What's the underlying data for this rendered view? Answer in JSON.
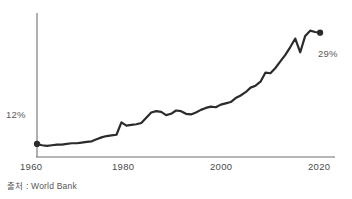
{
  "chart_data": {
    "type": "line",
    "title": "",
    "subtitle": "",
    "xlabel": "",
    "ylabel": "",
    "grid": false,
    "legend": "none",
    "xlim": [
      1960,
      2020
    ],
    "ylim": [
      10,
      32
    ],
    "xticks": [
      1960,
      1980,
      2000,
      2020
    ],
    "xtick_labels": [
      "1960",
      "1980",
      "2000",
      "2020"
    ],
    "annotations": [
      {
        "name": "start-value",
        "text": "12%",
        "x": 1960,
        "y": 12
      },
      {
        "name": "end-value",
        "text": "29%",
        "x": 2017,
        "y": 29
      }
    ],
    "markers": [
      {
        "name": "start-point",
        "x": 1960,
        "y": 12
      },
      {
        "name": "end-point",
        "x": 2017,
        "y": 29
      }
    ],
    "series": [
      {
        "name": "share",
        "color": "#2b2b2b",
        "x": [
          1960,
          1961,
          1962,
          1963,
          1964,
          1965,
          1966,
          1967,
          1968,
          1969,
          1970,
          1971,
          1972,
          1973,
          1974,
          1975,
          1976,
          1977,
          1978,
          1979,
          1980,
          1981,
          1982,
          1983,
          1984,
          1985,
          1986,
          1987,
          1988,
          1989,
          1990,
          1991,
          1992,
          1993,
          1994,
          1995,
          1996,
          1997,
          1998,
          1999,
          2000,
          2001,
          2002,
          2003,
          2004,
          2005,
          2006,
          2007,
          2008,
          2009,
          2010,
          2011,
          2012,
          2013,
          2014,
          2015,
          2016,
          2017
        ],
        "y": [
          12.0,
          11.8,
          11.7,
          11.8,
          11.9,
          11.9,
          12.0,
          12.1,
          12.1,
          12.2,
          12.3,
          12.4,
          12.7,
          13.0,
          13.2,
          13.3,
          13.4,
          15.3,
          14.8,
          14.9,
          15.0,
          15.2,
          16.0,
          16.8,
          17.0,
          16.9,
          16.4,
          16.6,
          17.1,
          17.0,
          16.6,
          16.5,
          16.8,
          17.2,
          17.5,
          17.7,
          17.6,
          18.0,
          18.2,
          18.4,
          19.0,
          19.4,
          19.9,
          20.6,
          20.9,
          21.5,
          22.9,
          22.8,
          23.6,
          24.6,
          25.6,
          26.8,
          28.1,
          26.0,
          28.5,
          29.3,
          29.1,
          29.0
        ]
      }
    ]
  },
  "labels": {
    "start_value": "12%",
    "end_value": "29%",
    "tick_1960": "1960",
    "tick_1980": "1980",
    "tick_2000": "2000",
    "tick_2020": "2020"
  },
  "source": {
    "note": "출처 : World Bank"
  },
  "colors": {
    "line": "#2b2b2b",
    "axis": "#6f6f6f",
    "text": "#4a4a4a",
    "background": "#ffffff"
  }
}
